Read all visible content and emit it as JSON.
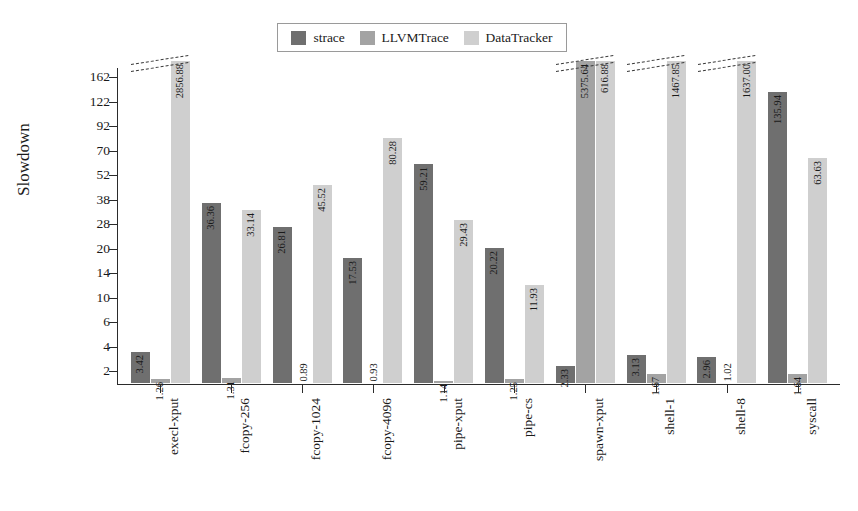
{
  "chart_data": {
    "type": "bar",
    "title": "",
    "xlabel": "",
    "ylabel": "Slowdown",
    "grid": false,
    "legend_position": "top-center",
    "scale": "log-like (compressed)",
    "axis_break_note": "Dashed double-slash break marks drawn above bars whose value exceeds the 162 axis maximum",
    "ylim": [
      1,
      162
    ],
    "yticks": [
      2,
      4,
      6,
      10,
      14,
      20,
      28,
      38,
      52,
      70,
      92,
      122,
      162
    ],
    "ytick_labels": [
      "2",
      "4",
      "6",
      "10",
      "14",
      "20",
      "28",
      "38",
      "52",
      "70",
      "92",
      "122",
      "162"
    ],
    "categories": [
      "execl-xput",
      "fcopy-256",
      "fcopy-1024",
      "fcopy-4096",
      "pipe-xput",
      "pipe-cs",
      "spawn-xput",
      "shell-1",
      "shell-8",
      "syscall"
    ],
    "series": [
      {
        "name": "strace",
        "color": "#6f6f6f",
        "values": [
          3.42,
          36.36,
          26.81,
          17.53,
          59.21,
          20.22,
          2.33,
          3.13,
          2.96,
          135.94
        ],
        "labels": [
          "3.42",
          "36.36",
          "26.81",
          "17.53",
          "59.21",
          "20.22",
          "2.33",
          "3.13",
          "2.96",
          "135.94"
        ]
      },
      {
        "name": "LLVMTrace",
        "color": "#a3a3a3",
        "values": [
          1.26,
          1.31,
          0.89,
          0.93,
          1.14,
          1.25,
          5375.64,
          1.67,
          1.02,
          1.64
        ],
        "labels": [
          "1.26",
          "1.31",
          "0.89",
          "0.93",
          "1.14",
          "1.25",
          "5375.64",
          "1.67",
          "1.02",
          "1.64"
        ]
      },
      {
        "name": "DataTracker",
        "color": "#cfcfcf",
        "values": [
          2856.88,
          33.14,
          45.52,
          80.28,
          29.43,
          11.93,
          616.88,
          1467.85,
          1637.0,
          63.63
        ],
        "labels": [
          "2856.88",
          "33.14",
          "45.52",
          "80.28",
          "29.43",
          "11.93",
          "616.88",
          "1467.85",
          "1637.00",
          "63.63"
        ]
      }
    ],
    "broken_categories": [
      "execl-xput",
      "spawn-xput",
      "shell-1",
      "shell-8"
    ]
  },
  "legend": {
    "items": [
      {
        "label": "strace",
        "color": "#6f6f6f"
      },
      {
        "label": "LLVMTrace",
        "color": "#a3a3a3"
      },
      {
        "label": "DataTracker",
        "color": "#cfcfcf"
      }
    ]
  },
  "axis": {
    "y_title": "Slowdown"
  }
}
